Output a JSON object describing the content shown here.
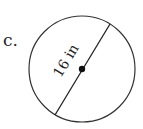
{
  "problem": {
    "label": "c.",
    "figure": {
      "shape": "circle",
      "measurement": "diameter",
      "dimension_label": "16 in",
      "value": 16,
      "unit": "in",
      "center_marked": true
    }
  }
}
